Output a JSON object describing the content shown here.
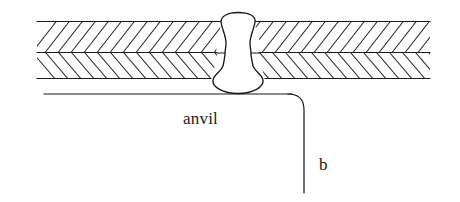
{
  "figure": {
    "kind": "technical-cross-section-diagram",
    "width": 460,
    "height": 202,
    "background_color": "#ffffff",
    "line_color": "#1a1a1a",
    "hatch_color": "#333333"
  },
  "labels": {
    "anvil": "anvil",
    "dimension_b": "b"
  },
  "parts": {
    "upper_sheet": {
      "name": "upper sheet",
      "hatch_pattern": "diagonal-chevron",
      "top_y": 22,
      "bottom_y": 52,
      "left_x": 37,
      "right_x": 430
    },
    "lower_sheet": {
      "name": "lower sheet",
      "hatch_pattern": "diagonal-chevron-mirrored",
      "top_y": 52,
      "bottom_y": 78,
      "left_x": 37,
      "right_x": 430
    },
    "weld_nugget": {
      "name": "weld nugget",
      "center_x": 238,
      "top_y": 13,
      "bottom_y": 94,
      "waist_half_width": 13,
      "bulge_half_width": 25
    },
    "anvil_surface": {
      "name": "anvil surface line",
      "y": 94,
      "left_x": 44,
      "right_x": 302
    },
    "leader_line": {
      "name": "dimension leader b",
      "corner_radius": 12,
      "vertical_x": 304,
      "bottom_y": 193
    }
  },
  "hatching": {
    "stroke_width": 1.1,
    "spacing": 13,
    "angle_degrees": 52,
    "left_group_direction": "down-right",
    "right_group_direction": "down-left"
  },
  "colors": {
    "ink": "#1a1a1a",
    "hatch": "#333333",
    "paper": "#ffffff"
  }
}
